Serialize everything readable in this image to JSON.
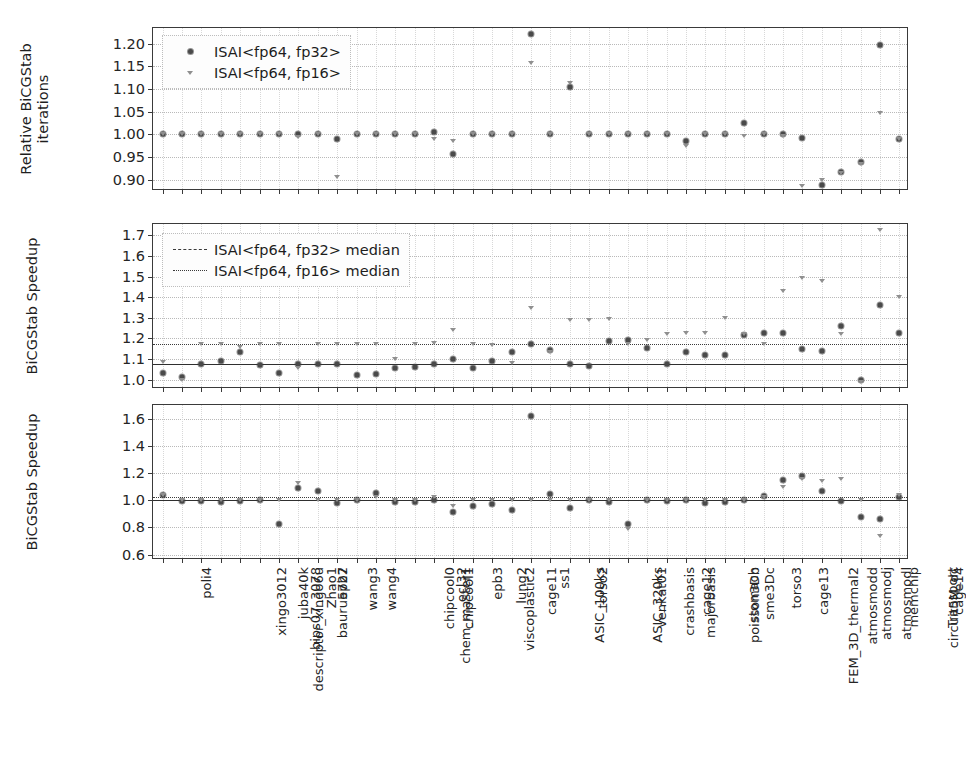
{
  "figure": {
    "width": 920,
    "height": 768,
    "background": "#ffffff",
    "marker_color_fp32": "#4a4a4a",
    "marker_color_fp16": "#8f8f8f",
    "grid_color": "#b9b9b9",
    "axis_color": "#3a3a3a"
  },
  "categories": [
    "poli4",
    "descriptor_xingo6u",
    "xingo3012",
    "bips07_3078",
    "juba40k",
    "bauru5727",
    "Zhao1",
    "epb2",
    "wang3",
    "wang4",
    "chem_master1",
    "chipcool0",
    "chipcool1",
    "ecl32",
    "viscoplastic2",
    "epb3",
    "lung2",
    "cage11",
    "ASIC_100ks",
    "ss1",
    "torso2",
    "ASIC_320ks",
    "venkat01",
    "crashbasis",
    "majorbasis",
    "cage12",
    "poisson3Db",
    "stomach",
    "sme3Dc",
    "FEM_3D_thermal2",
    "torso3",
    "cage13",
    "atmosmodd",
    "atmosmodj",
    "atmosmodl",
    "memchip",
    "circuit5M_dc",
    "Transport",
    "cage14"
  ],
  "legends": {
    "panel1": [
      {
        "label": "ISAI<fp64, fp32>",
        "symbol": "circle-marker"
      },
      {
        "label": "ISAI<fp64, fp16>",
        "symbol": "triangle-marker"
      }
    ],
    "panel2": [
      {
        "label": "ISAI<fp64, fp32> median",
        "symbol": "dashed-line"
      },
      {
        "label": "ISAI<fp64, fp16> median",
        "symbol": "dotted-line"
      }
    ]
  },
  "chart_data": [
    {
      "id": "panel1",
      "type": "scatter",
      "title": "",
      "ylabel": "Relative BiCGStab\niterations",
      "xlabel": "",
      "ylim": [
        0.875,
        1.235
      ],
      "yticks": [
        "0.90",
        "0.95",
        "1.00",
        "1.05",
        "1.10",
        "1.15",
        "1.20"
      ],
      "ytick_values": [
        0.9,
        0.95,
        1.0,
        1.05,
        1.1,
        1.15,
        1.2
      ],
      "grid": true,
      "legend_position": "upper left",
      "series": [
        {
          "name": "ISAI<fp64, fp32>",
          "marker": "circle-marker",
          "values": [
            1.0,
            1.0,
            1.0,
            1.0,
            1.0,
            1.0,
            1.0,
            1.0,
            1.0,
            0.99,
            1.0,
            1.0,
            1.0,
            1.0,
            1.005,
            0.956,
            1.0,
            1.0,
            1.0,
            1.222,
            1.0,
            1.105,
            1.0,
            1.0,
            1.0,
            1.0,
            1.0,
            0.985,
            1.0,
            1.0,
            1.025,
            1.0,
            1.0,
            0.993,
            0.888,
            0.916,
            0.938,
            1.198,
            0.99
          ]
        },
        {
          "name": "ISAI<fp64, fp16>",
          "marker": "triangle-marker",
          "values": [
            1.0,
            1.0,
            1.0,
            1.0,
            1.0,
            1.0,
            1.0,
            0.995,
            1.0,
            0.905,
            1.0,
            1.0,
            1.0,
            1.0,
            0.99,
            0.986,
            1.0,
            1.0,
            1.0,
            1.157,
            1.0,
            1.113,
            1.0,
            1.0,
            1.0,
            1.0,
            1.0,
            0.975,
            1.0,
            1.0,
            0.997,
            1.0,
            0.997,
            0.887,
            0.9,
            0.914,
            0.935,
            1.047,
            0.99
          ]
        }
      ]
    },
    {
      "id": "panel2",
      "type": "scatter",
      "title": "",
      "ylabel": "BiCGStab Speedup",
      "xlabel": "",
      "ylim": [
        0.955,
        1.755
      ],
      "yticks": [
        "1.0",
        "1.1",
        "1.2",
        "1.3",
        "1.4",
        "1.5",
        "1.6",
        "1.7"
      ],
      "ytick_values": [
        1.0,
        1.1,
        1.2,
        1.3,
        1.4,
        1.5,
        1.6,
        1.7
      ],
      "grid": true,
      "legend_position": "upper left",
      "median_fp32": 1.075,
      "median_fp16": 1.175,
      "series": [
        {
          "name": "ISAI<fp64, fp32>",
          "marker": "circle-marker",
          "values": [
            1.035,
            1.015,
            1.075,
            1.09,
            1.135,
            1.07,
            1.035,
            1.075,
            1.075,
            1.075,
            1.025,
            1.03,
            1.055,
            1.06,
            1.075,
            1.1,
            1.055,
            1.09,
            1.135,
            1.175,
            1.145,
            1.075,
            1.065,
            1.19,
            1.195,
            1.155,
            1.075,
            1.135,
            1.12,
            1.12,
            1.215,
            1.225,
            1.225,
            1.15,
            1.14,
            1.26,
            1.0,
            1.36,
            1.225
          ]
        },
        {
          "name": "ISAI<fp64, fp16>",
          "marker": "triangle-marker",
          "values": [
            1.085,
            1.0,
            1.175,
            1.175,
            1.16,
            1.175,
            1.175,
            1.055,
            1.175,
            1.175,
            1.175,
            1.175,
            1.1,
            1.175,
            1.18,
            1.24,
            1.175,
            1.17,
            1.08,
            1.35,
            1.135,
            1.29,
            1.29,
            1.295,
            1.175,
            1.195,
            1.22,
            1.225,
            1.225,
            1.3,
            1.22,
            1.175,
            1.43,
            1.495,
            1.48,
            1.22,
            0.99,
            1.725,
            1.4
          ]
        }
      ]
    },
    {
      "id": "panel3",
      "type": "scatter",
      "title": "",
      "ylabel": "BiCGStab Speedup",
      "xlabel": "",
      "ylim": [
        0.56,
        1.7
      ],
      "yticks": [
        "0.6",
        "0.8",
        "1.0",
        "1.2",
        "1.4",
        "1.6"
      ],
      "ytick_values": [
        0.6,
        0.8,
        1.0,
        1.2,
        1.4,
        1.6
      ],
      "grid": true,
      "median_fp32": 1.0,
      "median_fp16": 1.02,
      "series": [
        {
          "name": "ISAI<fp64, fp32>",
          "marker": "circle-marker",
          "values": [
            1.035,
            0.995,
            0.995,
            0.99,
            0.995,
            1.0,
            0.825,
            1.09,
            1.065,
            0.98,
            1.0,
            1.055,
            0.985,
            0.985,
            1.0,
            0.915,
            0.96,
            0.975,
            0.93,
            1.62,
            1.045,
            0.94,
            1.0,
            0.99,
            0.825,
            1.0,
            0.995,
            1.0,
            0.98,
            0.985,
            1.0,
            1.03,
            1.145,
            1.175,
            1.07,
            0.995,
            0.875,
            0.865,
            1.02
          ]
        },
        {
          "name": "ISAI<fp64, fp16>",
          "marker": "triangle-marker",
          "values": [
            1.035,
            1.0,
            1.0,
            1.0,
            1.0,
            1.0,
            1.0,
            1.13,
            1.0,
            1.0,
            1.0,
            1.02,
            1.0,
            1.0,
            1.02,
            0.955,
            1.0,
            1.0,
            1.0,
            1.0,
            1.0,
            1.0,
            1.0,
            1.0,
            0.785,
            1.0,
            1.0,
            1.0,
            1.0,
            1.0,
            1.0,
            1.025,
            1.1,
            1.155,
            1.14,
            1.155,
            1.0,
            0.735,
            1.035
          ]
        }
      ]
    }
  ]
}
